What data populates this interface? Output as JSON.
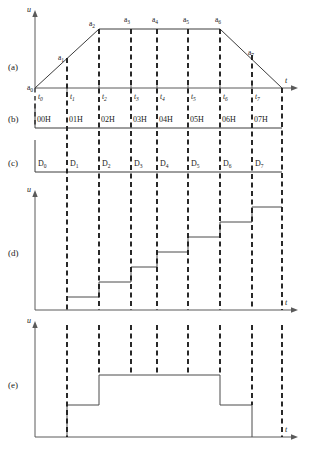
{
  "figure": {
    "type": "timing-diagram",
    "width": 311,
    "height": 457,
    "background": "#ffffff",
    "line_color": "#3c3c3c",
    "dash_color": "#1f1f1f"
  },
  "row_labels": [
    {
      "id": "a",
      "text": "(a)"
    },
    {
      "id": "b",
      "text": "(b)"
    },
    {
      "id": "c",
      "text": "(c)"
    },
    {
      "id": "d",
      "text": "(d)"
    },
    {
      "id": "e",
      "text": "(e)"
    }
  ],
  "axes": {
    "vertical_symbol": "u",
    "horizontal_symbol": "t"
  },
  "time_ticks": [
    {
      "label": "t",
      "sub": "0",
      "x": 35
    },
    {
      "label": "t",
      "sub": "1",
      "x": 67
    },
    {
      "label": "t",
      "sub": "2",
      "x": 99
    },
    {
      "label": "t",
      "sub": "3",
      "x": 131
    },
    {
      "label": "t",
      "sub": "4",
      "x": 157
    },
    {
      "label": "t",
      "sub": "5",
      "x": 188
    },
    {
      "label": "t",
      "sub": "6",
      "x": 220
    },
    {
      "label": "t",
      "sub": "7",
      "x": 252
    }
  ],
  "panel_a": {
    "title": "trapezoidal waveform with sample points",
    "points": [
      {
        "label": "a",
        "sub": "0",
        "x": 35,
        "y": 88
      },
      {
        "label": "a",
        "sub": "1",
        "x": 67,
        "y": 62
      },
      {
        "label": "a",
        "sub": "2",
        "x": 99,
        "y": 29
      },
      {
        "label": "a",
        "sub": "3",
        "x": 131,
        "y": 29
      },
      {
        "label": "a",
        "sub": "4",
        "x": 157,
        "y": 29
      },
      {
        "label": "a",
        "sub": "5",
        "x": 188,
        "y": 29
      },
      {
        "label": "a",
        "sub": "6",
        "x": 220,
        "y": 29
      },
      {
        "label": "a",
        "sub": "7",
        "x": 252,
        "y": 59
      }
    ]
  },
  "panel_b": {
    "title": "address bus values",
    "cells": [
      {
        "text": "00H",
        "x": 35
      },
      {
        "text": "01H",
        "x": 67
      },
      {
        "text": "02H",
        "x": 99
      },
      {
        "text": "03H",
        "x": 131
      },
      {
        "text": "04H",
        "x": 157
      },
      {
        "text": "05H",
        "x": 188
      },
      {
        "text": "06H",
        "x": 220
      },
      {
        "text": "07H",
        "x": 252
      }
    ]
  },
  "panel_c": {
    "title": "data bus values",
    "cells": [
      {
        "label": "D",
        "sub": "0",
        "x": 35
      },
      {
        "label": "D",
        "sub": "1",
        "x": 67
      },
      {
        "label": "D",
        "sub": "2",
        "x": 99
      },
      {
        "label": "D",
        "sub": "3",
        "x": 131
      },
      {
        "label": "D",
        "sub": "4",
        "x": 157
      },
      {
        "label": "D",
        "sub": "5",
        "x": 188
      },
      {
        "label": "D",
        "sub": "6",
        "x": 220
      },
      {
        "label": "D",
        "sub": "7",
        "x": 252
      }
    ]
  },
  "panel_d": {
    "title": "ascending staircase output",
    "steps": [
      {
        "x_start": 67,
        "x_end": 99,
        "level": 1
      },
      {
        "x_start": 99,
        "x_end": 131,
        "level": 2
      },
      {
        "x_start": 131,
        "x_end": 157,
        "level": 3
      },
      {
        "x_start": 157,
        "x_end": 188,
        "level": 4
      },
      {
        "x_start": 188,
        "x_end": 220,
        "level": 5
      },
      {
        "x_start": 220,
        "x_end": 252,
        "level": 6
      },
      {
        "x_start": 252,
        "x_end": 282,
        "level": 7
      }
    ]
  },
  "panel_e": {
    "title": "three level pulse output",
    "segments": [
      {
        "x_start": 67,
        "x_end": 99,
        "level": "mid"
      },
      {
        "x_start": 99,
        "x_end": 220,
        "level": "high"
      },
      {
        "x_start": 220,
        "x_end": 252,
        "level": "mid"
      }
    ]
  }
}
